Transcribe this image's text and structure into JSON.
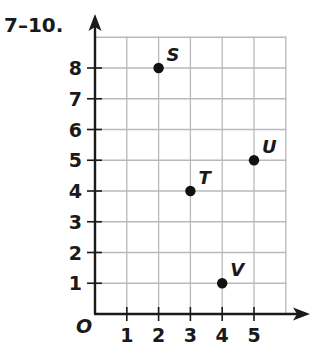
{
  "problem": {
    "label": "7–10."
  },
  "origin_label": "O",
  "colors": {
    "grid": "#b9b9b9",
    "axis": "#1a1a1a",
    "point": "#111111"
  },
  "chart_data": {
    "type": "scatter",
    "title": "7–10.",
    "xlabel": "",
    "ylabel": "",
    "xlim": [
      0,
      6
    ],
    "ylim": [
      0,
      9
    ],
    "grid": true,
    "x_ticks": [
      1,
      2,
      3,
      4,
      5
    ],
    "y_ticks": [
      1,
      2,
      3,
      4,
      5,
      6,
      7,
      8
    ],
    "origin_label": "O",
    "points": [
      {
        "label": "S",
        "x": 2,
        "y": 8
      },
      {
        "label": "T",
        "x": 3,
        "y": 4
      },
      {
        "label": "U",
        "x": 5,
        "y": 5
      },
      {
        "label": "V",
        "x": 4,
        "y": 1
      }
    ]
  }
}
